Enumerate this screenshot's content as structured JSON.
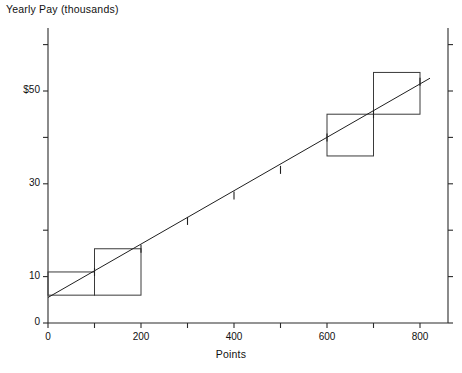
{
  "chart_data": {
    "type": "scatter",
    "title": "",
    "ylabel": "Yearly Pay (thousands)",
    "xlabel": "Points",
    "xlim": [
      0,
      860
    ],
    "ylim": [
      0,
      62
    ],
    "grid": false,
    "legend": null,
    "x_ticks": [
      {
        "value": 0,
        "label": "0"
      },
      {
        "value": 100,
        "label": ""
      },
      {
        "value": 200,
        "label": "200"
      },
      {
        "value": 300,
        "label": ""
      },
      {
        "value": 400,
        "label": "400"
      },
      {
        "value": 500,
        "label": ""
      },
      {
        "value": 600,
        "label": "600"
      },
      {
        "value": 700,
        "label": ""
      },
      {
        "value": 800,
        "label": "800"
      }
    ],
    "y_ticks": [
      {
        "value": 0,
        "label": "0"
      },
      {
        "value": 10,
        "label": "10"
      },
      {
        "value": 20,
        "label": ""
      },
      {
        "value": 30,
        "label": "30"
      },
      {
        "value": 40,
        "label": ""
      },
      {
        "value": 50,
        "label": "$50"
      },
      {
        "value": 60,
        "label": ""
      }
    ],
    "series": [
      {
        "name": "Data points",
        "marker": "vertical-tick",
        "x": [
          100,
          200,
          300,
          400,
          500,
          600,
          700,
          800
        ],
        "values": [
          11,
          16,
          22,
          27.5,
          33,
          40,
          45,
          52
        ]
      }
    ],
    "fit_line": {
      "name": "Least-squares line",
      "x": [
        0,
        800
      ],
      "values": [
        5.5,
        52.5
      ]
    },
    "residual_squares": [
      {
        "x0": 0,
        "x1": 100,
        "y0": 6,
        "y1": 11
      },
      {
        "x0": 100,
        "x1": 200,
        "y0": 6,
        "y1": 16
      },
      {
        "x0": 600,
        "x1": 700,
        "y0": 36,
        "y1": 45
      },
      {
        "x0": 700,
        "x1": 800,
        "y0": 45,
        "y1": 54
      }
    ],
    "colors": {
      "axis": "#2b2b2b",
      "line": "#1f1f1f",
      "square": "#3a3a3a",
      "text": "#111111",
      "background": "#ffffff"
    }
  }
}
